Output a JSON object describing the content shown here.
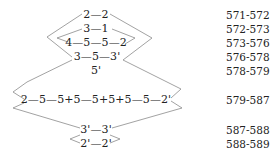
{
  "rows": [
    {
      "sequence": "2—2",
      "range": "571-572"
    },
    {
      "sequence": "3—1",
      "range": "572-573"
    },
    {
      "sequence": "4—5—5—2",
      "range": "573-576"
    },
    {
      "sequence": "3—5—3'",
      "range": "576-578"
    },
    {
      "sequence": "5'",
      "range": "578-579"
    },
    {
      "sequence": "2—5—5+5—5+5+5—5—2'",
      "range": "579-587"
    },
    {
      "sequence": "3'—3'",
      "range": "587-588"
    },
    {
      "sequence": "2'—2'",
      "range": "588-589"
    }
  ],
  "style": {
    "line_color": "#8a8a8a",
    "text_color": "#222222"
  }
}
